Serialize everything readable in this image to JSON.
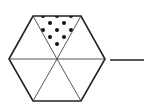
{
  "figure": {
    "hexagon": {
      "center": [
        57,
        59
      ],
      "vertices": [
        [
          9,
          59
        ],
        [
          33,
          16
        ],
        [
          81,
          16
        ],
        [
          105,
          59
        ],
        [
          81,
          101
        ],
        [
          33,
          101
        ]
      ],
      "stroke": "#222222",
      "divisions": 6,
      "shaded_sections": 1
    },
    "shaded_triangle": {
      "position": "top",
      "pattern": "dots",
      "dots": [
        [
          43,
          16
        ],
        [
          57,
          16
        ],
        [
          71,
          16
        ],
        [
          50,
          23
        ],
        [
          64,
          23
        ],
        [
          43,
          30
        ],
        [
          57,
          30
        ],
        [
          71,
          30
        ],
        [
          50,
          37
        ],
        [
          64,
          37
        ],
        [
          57,
          44
        ]
      ],
      "dot_color": "#111111"
    },
    "answer_line": {
      "from": [
        110,
        60
      ],
      "to": [
        144,
        60
      ],
      "color": "#222222"
    }
  }
}
